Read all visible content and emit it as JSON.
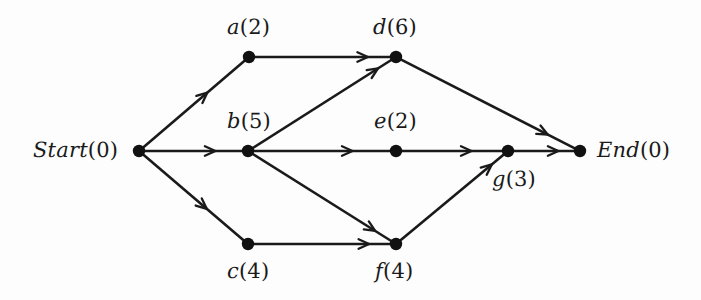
{
  "diagram": {
    "background_color": "#fdfdfd",
    "ink_color": "#1a1a1a",
    "nodes": [
      {
        "id": "start",
        "label": "Start(0)",
        "name": "Start",
        "duration": 0,
        "x": 139,
        "y": 151,
        "label_x": 33,
        "label_y": 140,
        "label_pos": "left"
      },
      {
        "id": "a",
        "label": "a(2)",
        "name": "a",
        "duration": 2,
        "x": 249,
        "y": 57,
        "label_x": 227,
        "label_y": 17,
        "label_pos": "above"
      },
      {
        "id": "b",
        "label": "b(5)",
        "name": "b",
        "duration": 5,
        "x": 248,
        "y": 151,
        "label_x": 227,
        "label_y": 111,
        "label_pos": "above"
      },
      {
        "id": "c",
        "label": "c(4)",
        "name": "c",
        "duration": 4,
        "x": 248,
        "y": 244,
        "label_x": 227,
        "label_y": 261,
        "label_pos": "below"
      },
      {
        "id": "d",
        "label": "d(6)",
        "name": "d",
        "duration": 6,
        "x": 396,
        "y": 57,
        "label_x": 373,
        "label_y": 17,
        "label_pos": "above"
      },
      {
        "id": "e",
        "label": "e(2)",
        "name": "e",
        "duration": 2,
        "x": 396,
        "y": 151,
        "label_x": 374,
        "label_y": 111,
        "label_pos": "above"
      },
      {
        "id": "f",
        "label": "f(4)",
        "name": "f",
        "duration": 4,
        "x": 396,
        "y": 244,
        "label_x": 375,
        "label_y": 261,
        "label_pos": "below"
      },
      {
        "id": "g",
        "label": "g(3)",
        "name": "g",
        "duration": 3,
        "x": 508,
        "y": 151,
        "label_x": 492,
        "label_y": 169,
        "label_pos": "below"
      },
      {
        "id": "end",
        "label": "End(0)",
        "name": "End",
        "duration": 0,
        "x": 580,
        "y": 151,
        "label_x": 597,
        "label_y": 140,
        "label_pos": "right"
      }
    ],
    "edges": [
      {
        "from": "start",
        "to": "a",
        "arrow_t": 0.63
      },
      {
        "from": "start",
        "to": "b",
        "arrow_t": 0.72
      },
      {
        "from": "start",
        "to": "c",
        "arrow_t": 0.63
      },
      {
        "from": "a",
        "to": "d",
        "arrow_t": 0.83
      },
      {
        "from": "b",
        "to": "d",
        "arrow_t": 0.9
      },
      {
        "from": "b",
        "to": "e",
        "arrow_t": 0.72
      },
      {
        "from": "b",
        "to": "f",
        "arrow_t": 0.88
      },
      {
        "from": "c",
        "to": "f",
        "arrow_t": 0.84
      },
      {
        "from": "d",
        "to": "end",
        "arrow_t": 0.84
      },
      {
        "from": "e",
        "to": "g",
        "arrow_t": 0.69
      },
      {
        "from": "f",
        "to": "g",
        "arrow_t": 0.88
      },
      {
        "from": "g",
        "to": "end",
        "arrow_t": 0.73
      }
    ],
    "node_radius": 6.2
  }
}
